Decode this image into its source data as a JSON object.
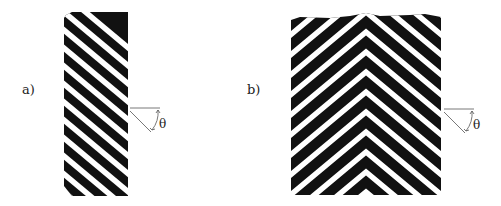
{
  "figure": {
    "panels": [
      {
        "id": "a",
        "label": "a)",
        "pattern": "parallel diagonal stripes",
        "angle_symbol": "θ"
      },
      {
        "id": "b",
        "label": "b)",
        "pattern": "chevron stripes",
        "angle_symbol": "θ"
      }
    ],
    "colors": {
      "stripe_dark": "#111111",
      "stripe_light": "#ffffff",
      "annotation": "#444444"
    }
  }
}
